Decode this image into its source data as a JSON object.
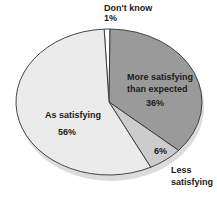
{
  "chart_data": {
    "type": "pie",
    "title": "",
    "slices": [
      {
        "label": "Don't know",
        "value": 1,
        "pct_label": "1%",
        "color": "#ffffff"
      },
      {
        "label": "More satisfying than expected",
        "value": 36,
        "pct_label": "36%",
        "color": "#9a9a9a"
      },
      {
        "label": "Less satisfying",
        "value": 6,
        "pct_label": "6%",
        "color": "#cccccc"
      },
      {
        "label": "As satisfying",
        "value": 56,
        "pct_label": "56%",
        "color": "#ebebeb"
      }
    ],
    "start_angle_deg": -93,
    "direction": "clockwise",
    "legend": "none"
  },
  "labels": {
    "dont_know": "Don't know",
    "dont_know_pct": "1%",
    "more_line1": "More satisfying",
    "more_line2": "than expected",
    "more_pct": "36%",
    "less_line1": "Less",
    "less_line2": "satisfying",
    "less_pct": "6%",
    "as_label": "As satisfying",
    "as_pct": "56%"
  }
}
